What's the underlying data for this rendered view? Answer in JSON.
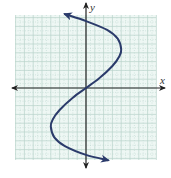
{
  "chart_data": {
    "type": "line",
    "title": "",
    "xlabel": "x",
    "ylabel": "y",
    "grid": true,
    "xlim": [
      -8,
      8
    ],
    "ylim": [
      -8,
      8
    ],
    "tick_labels": false,
    "series": [
      {
        "name": "curve",
        "color": "#2b3b6b",
        "points": [
          {
            "x": -2.4,
            "y": 8.4
          },
          {
            "x": 0.0,
            "y": 7.6
          },
          {
            "x": 2.4,
            "y": 6.6
          },
          {
            "x": 3.6,
            "y": 5.6
          },
          {
            "x": 4.0,
            "y": 4.4
          },
          {
            "x": 3.8,
            "y": 3.6
          },
          {
            "x": 3.0,
            "y": 2.5
          },
          {
            "x": 1.5,
            "y": 1.1
          },
          {
            "x": 0.0,
            "y": 0.0
          },
          {
            "x": -1.5,
            "y": -1.1
          },
          {
            "x": -3.0,
            "y": -2.5
          },
          {
            "x": -3.8,
            "y": -3.6
          },
          {
            "x": -4.0,
            "y": -4.4
          },
          {
            "x": -3.6,
            "y": -5.6
          },
          {
            "x": -2.4,
            "y": -6.6
          },
          {
            "x": 0.0,
            "y": -7.6
          },
          {
            "x": 2.5,
            "y": -8.2
          }
        ]
      }
    ]
  },
  "axes": {
    "x_label": "x",
    "y_label": "y"
  },
  "colors": {
    "grid_background": "#eef7f4",
    "grid_line": "#b7d2ca",
    "axis": "#222222",
    "curve": "#2b3b6b"
  }
}
